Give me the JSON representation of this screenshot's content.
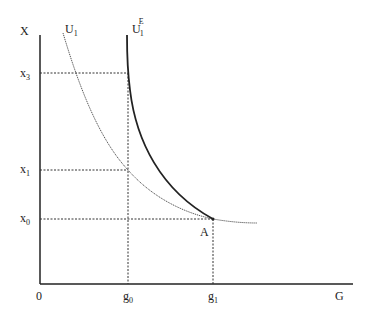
{
  "diagram": {
    "type": "indifference-curve diagram",
    "axes": {
      "y_label": "X",
      "x_label": "G",
      "origin_label": "0"
    },
    "y_ticks": [
      {
        "base": "x",
        "sub": "3",
        "y": 73
      },
      {
        "base": "x",
        "sub": "1",
        "y": 170
      },
      {
        "base": "x",
        "sub": "0",
        "y": 219
      }
    ],
    "x_ticks": [
      {
        "base": "g",
        "sub": "0",
        "x": 128
      },
      {
        "base": "g",
        "sub": "1",
        "x": 213
      }
    ],
    "curves": [
      {
        "name": "U1",
        "label_base": "U",
        "label_sub": "1",
        "label_sup": "",
        "style": "dotted thin"
      },
      {
        "name": "U1E",
        "label_base": "U",
        "label_sub": "1",
        "label_sup": "E",
        "style": "solid thick"
      }
    ],
    "points": [
      {
        "label": "A",
        "x": 213,
        "y": 219
      }
    ],
    "colors": {
      "axis": "#222222",
      "curve": "#333333",
      "guide": "#333333",
      "background": "#ffffff"
    }
  }
}
